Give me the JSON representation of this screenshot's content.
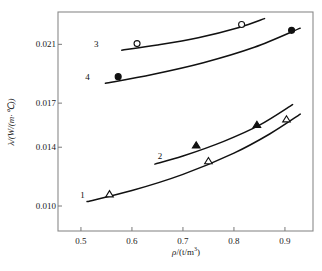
{
  "chart_data": {
    "type": "scatter",
    "title": "",
    "subtitle": "",
    "xlabel": "ρ/(t/m³)",
    "ylabel": "λ/(W/(m·°C))",
    "xlim": [
      0.455,
      0.955
    ],
    "ylim": [
      0.0083,
      0.0232
    ],
    "xticks": [
      0.5,
      0.6,
      0.7,
      0.8,
      0.9
    ],
    "xtick_labels": [
      "0.5",
      "0.6",
      "0.7",
      "0.8",
      "0.9"
    ],
    "yticks": [
      0.01,
      0.014,
      0.017,
      0.021
    ],
    "ytick_labels": [
      "0.010",
      "0.014",
      "0.017",
      "0.021"
    ],
    "grid": false,
    "legend_position": "inline-curve-labels",
    "frame": true,
    "series": [
      {
        "name": "1",
        "label": "1",
        "marker": "open-triangle",
        "color": "#111111",
        "label_point": {
          "x": 0.503,
          "y": 0.01075
        },
        "points": [
          {
            "x": 0.556,
            "y": 0.0108
          },
          {
            "x": 0.75,
            "y": 0.01305
          },
          {
            "x": 0.903,
            "y": 0.0159
          }
        ],
        "curve": [
          {
            "x": 0.512,
            "y": 0.0103
          },
          {
            "x": 0.6,
            "y": 0.01105
          },
          {
            "x": 0.7,
            "y": 0.01215
          },
          {
            "x": 0.8,
            "y": 0.0136
          },
          {
            "x": 0.87,
            "y": 0.0149
          },
          {
            "x": 0.93,
            "y": 0.01625
          }
        ]
      },
      {
        "name": "2",
        "label": "2",
        "marker": "filled-triangle",
        "color": "#111111",
        "label_point": {
          "x": 0.655,
          "y": 0.0134
        },
        "points": [
          {
            "x": 0.726,
            "y": 0.01412
          },
          {
            "x": 0.845,
            "y": 0.01552
          }
        ],
        "curve": [
          {
            "x": 0.645,
            "y": 0.01285
          },
          {
            "x": 0.7,
            "y": 0.0134
          },
          {
            "x": 0.78,
            "y": 0.0144
          },
          {
            "x": 0.85,
            "y": 0.0155
          },
          {
            "x": 0.915,
            "y": 0.0169
          }
        ]
      },
      {
        "name": "3",
        "label": "3",
        "marker": "open-circle",
        "color": "#111111",
        "label_point": {
          "x": 0.53,
          "y": 0.021
        },
        "points": [
          {
            "x": 0.61,
            "y": 0.02105
          },
          {
            "x": 0.815,
            "y": 0.02235
          }
        ],
        "curve": [
          {
            "x": 0.58,
            "y": 0.0206
          },
          {
            "x": 0.65,
            "y": 0.02095
          },
          {
            "x": 0.73,
            "y": 0.02145
          },
          {
            "x": 0.81,
            "y": 0.02215
          },
          {
            "x": 0.86,
            "y": 0.02275
          }
        ]
      },
      {
        "name": "4",
        "label": "4",
        "marker": "filled-circle",
        "color": "#111111",
        "label_point": {
          "x": 0.513,
          "y": 0.01875
        },
        "points": [
          {
            "x": 0.573,
            "y": 0.0188
          },
          {
            "x": 0.913,
            "y": 0.02195
          }
        ],
        "curve": [
          {
            "x": 0.548,
            "y": 0.01835
          },
          {
            "x": 0.64,
            "y": 0.01895
          },
          {
            "x": 0.74,
            "y": 0.01975
          },
          {
            "x": 0.84,
            "y": 0.0208
          },
          {
            "x": 0.93,
            "y": 0.0221
          }
        ]
      }
    ]
  },
  "axes": {
    "x_title_main": "ρ",
    "x_title_rest": "/(t/m",
    "x_title_sup": "3",
    "x_title_close": ")",
    "y_title": "λ/(W/(m·℃))"
  }
}
